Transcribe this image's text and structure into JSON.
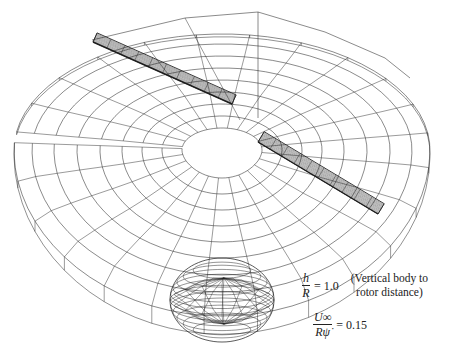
{
  "figure": {
    "line_color": "#1a1a1a",
    "background": "#ffffff"
  },
  "annotations": {
    "height_ratio": {
      "numerator": "h",
      "denominator": "R",
      "equals": "= 1.0",
      "note_line1": "(Vertical body to",
      "note_line2": "rotor distance)"
    },
    "advance_ratio": {
      "numerator": "U∞",
      "denominator": "Rψ̇",
      "equals": "= 0.15"
    }
  }
}
